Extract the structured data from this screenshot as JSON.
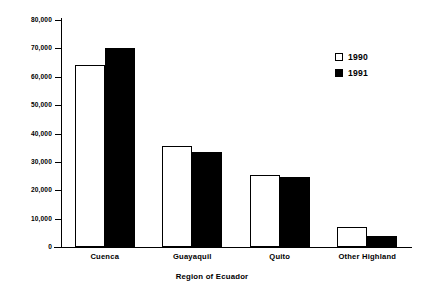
{
  "chart_data": {
    "type": "bar",
    "title": "",
    "xlabel": "Region of Ecuador",
    "ylabel": "Number of Letters",
    "categories": [
      "Cuenca",
      "Guayaquil",
      "Quito",
      "Other Highland"
    ],
    "series": [
      {
        "name": "1990",
        "values": [
          64000,
          35500,
          25500,
          7000
        ],
        "color": "#ffffff"
      },
      {
        "name": "1991",
        "values": [
          70000,
          33500,
          24500,
          4000
        ],
        "color": "#000000"
      }
    ],
    "ylim": [
      0,
      80000
    ],
    "ytick_values": [
      0,
      10000,
      20000,
      30000,
      40000,
      50000,
      60000,
      70000,
      80000
    ],
    "ytick_labels": [
      "0",
      "10,000",
      "20,000",
      "30,000",
      "40,000",
      "50,000",
      "60,000",
      "70,000",
      "80,000"
    ],
    "grid": false,
    "legend_position": "upper-right",
    "legend": [
      {
        "label": "1990",
        "marker": "hollow-square"
      },
      {
        "label": "1991",
        "marker": "filled-square"
      }
    ]
  }
}
